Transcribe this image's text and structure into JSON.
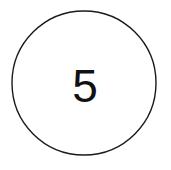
{
  "image": {
    "width": 171,
    "height": 170,
    "background_color": "#ffffff"
  },
  "figure": {
    "type": "circle-with-number",
    "shape": {
      "name": "circle-outline",
      "center_x": 84,
      "center_y": 83,
      "radius": 72,
      "stroke_color": "#1a1a1a",
      "stroke_width": 1.4,
      "fill_color": "#ffffff"
    },
    "label": {
      "text": "5",
      "color": "#111111",
      "font_size": 46,
      "center_x": 85,
      "center_y": 87
    }
  }
}
